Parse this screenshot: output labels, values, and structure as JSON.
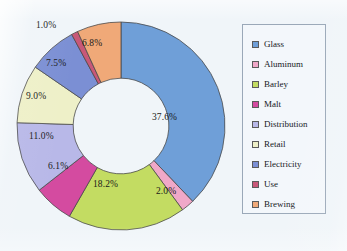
{
  "chart_data": {
    "type": "pie",
    "variant": "donut",
    "title": "",
    "subtitle": "",
    "xlabel": "",
    "ylabel": "",
    "grid": false,
    "legend_position": "right",
    "start_angle_deg": 0,
    "direction": "clockwise",
    "inner_radius_ratio": 0.46,
    "units": "%",
    "categories": [
      "Glass",
      "Aluminum",
      "Barley",
      "Malt",
      "Distribution",
      "Retail",
      "Electricity",
      "Use",
      "Brewing"
    ],
    "values": [
      37.6,
      2.0,
      18.2,
      6.1,
      11.0,
      9.0,
      7.5,
      1.0,
      6.8
    ],
    "value_labels": [
      "37.6%",
      "2.0%",
      "18.2%",
      "6.1%",
      "11.0%",
      "9.0%",
      "7.5%",
      "1.0%",
      "6.8%"
    ],
    "colors": [
      "#6f9fd8",
      "#f0a8c8",
      "#c3dc62",
      "#d44ba0",
      "#b8b8e8",
      "#eef0c8",
      "#7b8fd4",
      "#c85878",
      "#f0a978"
    ],
    "slice_label_placement": [
      "inside",
      "outside",
      "inside",
      "inside",
      "inside",
      "inside",
      "inside",
      "outside",
      "inside"
    ]
  },
  "legend": {
    "items": [
      {
        "label": "Glass",
        "color": "#6f9fd8"
      },
      {
        "label": "Aluminum",
        "color": "#f0a8c8"
      },
      {
        "label": "Barley",
        "color": "#c3dc62"
      },
      {
        "label": "Malt",
        "color": "#d44ba0"
      },
      {
        "label": "Distribution",
        "color": "#b8b8e8"
      },
      {
        "label": "Retail",
        "color": "#eef0c8"
      },
      {
        "label": "Electricity",
        "color": "#7b8fd4"
      },
      {
        "label": "Use",
        "color": "#c85878"
      },
      {
        "label": "Brewing",
        "color": "#f0a978"
      }
    ]
  },
  "style": {
    "background": "#f0f5f9",
    "legend_background": "#f3f7fb",
    "legend_border": "#9aa8b8",
    "slice_outline": "#4a4a4a",
    "label_color": "#1a1a1a"
  },
  "labels": {
    "glass": "37.6%",
    "aluminum": "2.0%",
    "barley": "18.2%",
    "malt": "6.1%",
    "distribution": "11.0%",
    "retail": "9.0%",
    "electricity": "7.5%",
    "use": "1.0%",
    "brewing": "6.8%"
  }
}
